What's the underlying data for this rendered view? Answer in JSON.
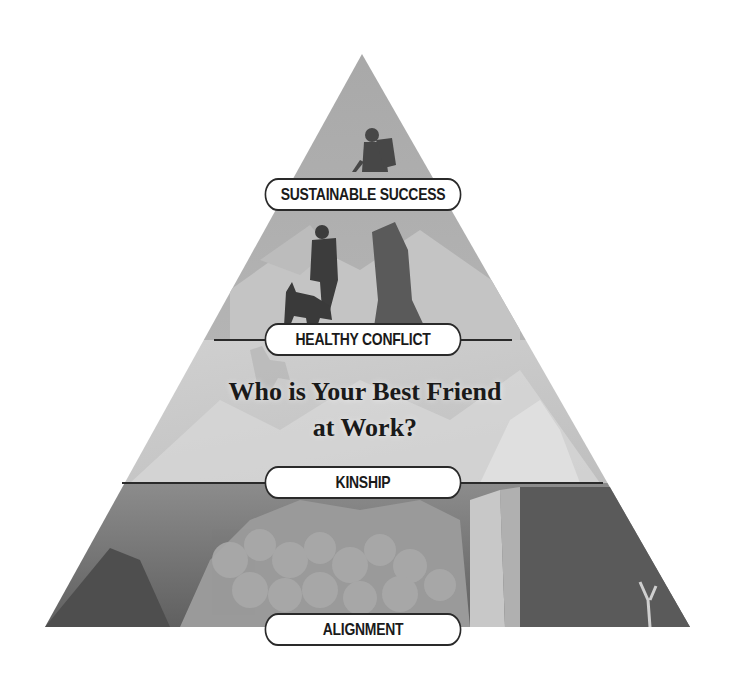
{
  "diagram": {
    "type": "pyramid",
    "title": "Who is Your Best Friend at Work?",
    "title_lines": [
      "Who is Your Best Friend",
      "at Work?"
    ],
    "levels": [
      {
        "order": 1,
        "label": "SUSTAINABLE SUCCESS",
        "position": "top"
      },
      {
        "order": 2,
        "label": "HEALTHY CONFLICT",
        "position": "upper-middle"
      },
      {
        "order": 3,
        "label": "KINSHIP",
        "position": "lower-middle"
      },
      {
        "order": 4,
        "label": "ALIGNMENT",
        "position": "base"
      }
    ],
    "illustration": "grayscale mountain landscape with hikers and a dog climbing toward the summit",
    "colors": {
      "background": "#ffffff",
      "band_top": "#9a9a9a",
      "band_middle": "#c8c8c8",
      "band_bottom": "#6e6e6e",
      "divider": "#2a2a2a",
      "pill_fill": "#ffffff",
      "pill_border": "#2a2a2a",
      "text": "#1a1a1a"
    }
  }
}
